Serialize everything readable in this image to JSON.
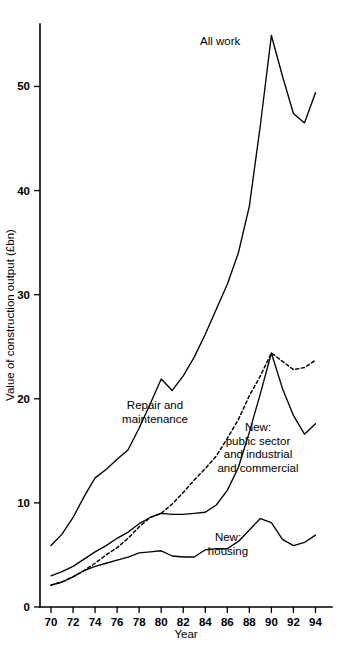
{
  "chart_data": {
    "type": "line",
    "title": "",
    "xlabel": "Year",
    "ylabel": "Value of construction output (£bn)",
    "xlim": [
      69,
      95.5
    ],
    "ylim": [
      0,
      56
    ],
    "grid": false,
    "legend_position": "inline-annotations",
    "x_ticks": [
      "70",
      "72",
      "74",
      "76",
      "78",
      "80",
      "82",
      "84",
      "86",
      "88",
      "90",
      "92",
      "94"
    ],
    "x_tick_values": [
      70,
      72,
      74,
      76,
      78,
      80,
      82,
      84,
      86,
      88,
      90,
      92,
      94
    ],
    "y_ticks": [
      "0",
      "10",
      "20",
      "30",
      "40",
      "50"
    ],
    "y_tick_values": [
      0,
      10,
      20,
      30,
      40,
      50
    ],
    "x": [
      70,
      71,
      72,
      73,
      74,
      75,
      76,
      77,
      78,
      79,
      80,
      81,
      82,
      83,
      84,
      85,
      86,
      87,
      88,
      89,
      90,
      91,
      92,
      93,
      94
    ],
    "series": [
      {
        "name": "All work",
        "style": "solid",
        "values": [
          5.9,
          7.0,
          8.6,
          10.6,
          12.4,
          13.2,
          14.2,
          15.1,
          17.2,
          19.5,
          21.9,
          20.8,
          22.2,
          24.0,
          26.2,
          28.6,
          31.0,
          34.0,
          38.5,
          46.3,
          54.9,
          51.0,
          47.4,
          46.5,
          49.4
        ]
      },
      {
        "name": "Repair and maintenance",
        "style": "dashed",
        "values": [
          2.1,
          2.4,
          2.9,
          3.5,
          4.2,
          5.0,
          5.7,
          6.6,
          7.7,
          8.6,
          9.0,
          9.9,
          11.0,
          12.2,
          13.3,
          14.5,
          16.2,
          18.0,
          20.3,
          22.2,
          24.4,
          23.6,
          22.8,
          23.0,
          23.7
        ]
      },
      {
        "name": "New: public sector and industrial and commercial",
        "style": "solid",
        "values": [
          3.0,
          3.4,
          3.9,
          4.6,
          5.3,
          5.9,
          6.6,
          7.2,
          8.0,
          8.6,
          9.0,
          8.9,
          8.9,
          9.0,
          9.1,
          9.8,
          11.2,
          13.4,
          16.8,
          20.5,
          24.4,
          21.0,
          18.4,
          16.6,
          17.6
        ]
      },
      {
        "name": "New: housing",
        "style": "solid",
        "values": [
          2.1,
          2.4,
          2.9,
          3.5,
          3.9,
          4.2,
          4.5,
          4.8,
          5.2,
          5.3,
          5.4,
          4.9,
          4.8,
          4.8,
          5.5,
          5.6,
          5.6,
          6.3,
          7.4,
          8.5,
          8.1,
          6.5,
          5.9,
          6.2,
          6.9
        ]
      }
    ],
    "annotations": [
      {
        "text": "All work",
        "x_px": 200,
        "y_px": 42
      },
      {
        "text": "Repair and\nmaintenance",
        "x_px": 155,
        "y_px": 406
      },
      {
        "text": "New:\npublic sector\nand industrial\nand commercial",
        "x_px": 258,
        "y_px": 435
      },
      {
        "text": "New:\nhousing",
        "x_px": 228,
        "y_px": 539
      }
    ]
  },
  "axis": {
    "y_title": "Value of construction output (£bn)",
    "x_title": "Year"
  },
  "labels": {
    "all_work": "All work",
    "repair_and_maintenance": "Repair and\nmaintenance",
    "new_public_sector": "New:\npublic sector\nand industrial\nand commercial",
    "new_housing": "New:\nhousing"
  },
  "colors": {
    "line": "#000000",
    "background": "#ffffff"
  }
}
